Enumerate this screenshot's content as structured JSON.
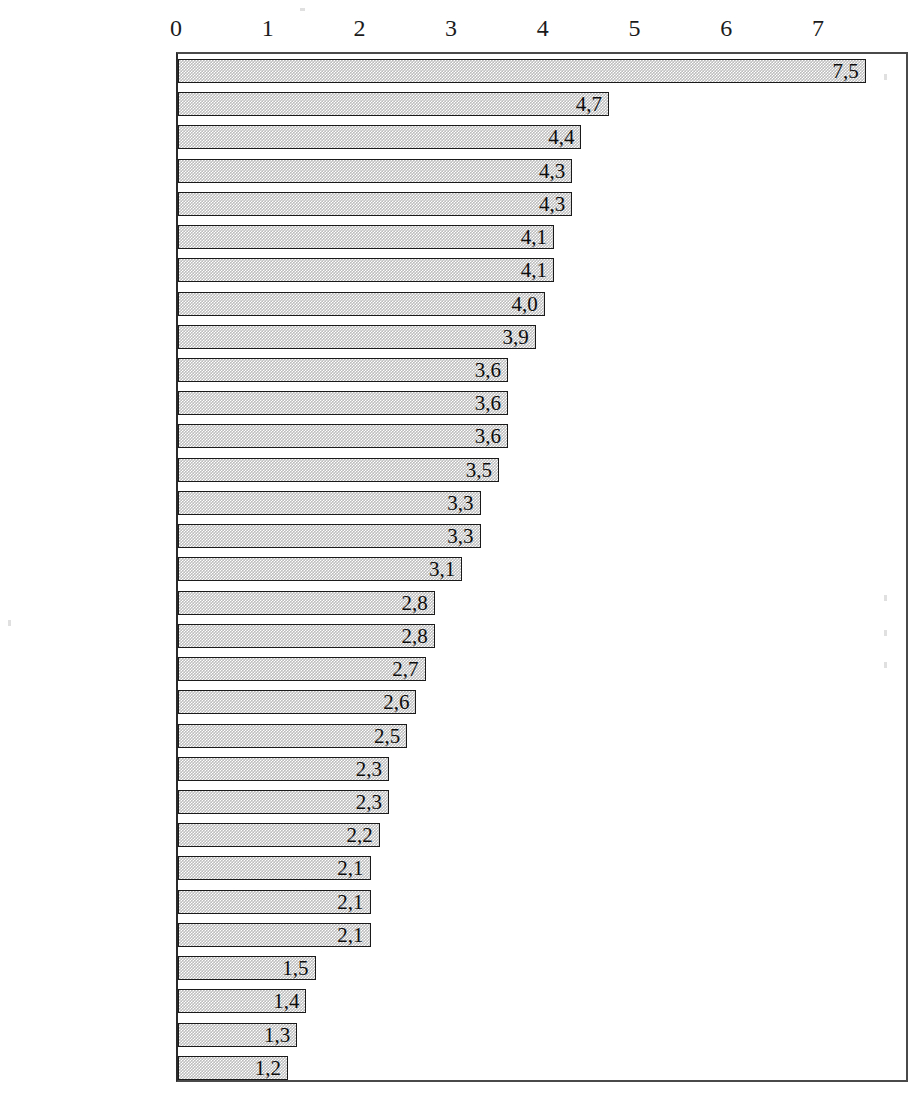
{
  "chart_data": {
    "type": "bar",
    "orientation": "horizontal",
    "title": "",
    "subtitle": "",
    "xlabel": "",
    "ylabel": "",
    "xlim": [
      0,
      7.6
    ],
    "xticks": [
      0,
      1,
      2,
      3,
      4,
      5,
      6,
      7
    ],
    "xtick_labels": [
      "0",
      "1",
      "2",
      "3",
      "4",
      "5",
      "6",
      "7"
    ],
    "grid": false,
    "legend": null,
    "decimal_separator": ",",
    "value_label_position": "inside-end",
    "bar_fill_color": "#bdbdbd",
    "bar_border_color": "#1a1a1a",
    "axis_color": "#2a2a2a",
    "categories": [
      "Irland",
      "Luxemburg",
      "Korea",
      "Island",
      "Slowak. Rep.",
      "Türkei",
      "Ungarn",
      "Polen",
      "Griechenland",
      "Mexiko",
      "Spanien",
      "Australien",
      "Finnland",
      "Verein. Staaten",
      "Kanada",
      "Neuseeland",
      "Norwegen",
      "Ver. Königreich",
      "Schweden",
      "OECD insgesamt",
      "Tschech. Rep.",
      "Portugal",
      "Niederlande",
      "Österreich",
      "Frankreich",
      "Dänemark",
      "Belgien",
      "Schweiz",
      "Deutschland",
      "Italien",
      "Japan"
    ],
    "values": [
      7.5,
      4.7,
      4.4,
      4.3,
      4.3,
      4.1,
      4.1,
      4.0,
      3.9,
      3.6,
      3.6,
      3.6,
      3.5,
      3.3,
      3.3,
      3.1,
      2.8,
      2.8,
      2.7,
      2.6,
      2.5,
      2.3,
      2.3,
      2.2,
      2.1,
      2.1,
      2.1,
      1.5,
      1.4,
      1.3,
      1.2
    ],
    "value_labels": [
      "7,5",
      "4,7",
      "4,4",
      "4,3",
      "4,3",
      "4,1",
      "4,1",
      "4,0",
      "3,9",
      "3,6",
      "3,6",
      "3,6",
      "3,5",
      "3,3",
      "3,3",
      "3,1",
      "2,8",
      "2,8",
      "2,7",
      "2,6",
      "2,5",
      "2,3",
      "2,3",
      "2,2",
      "2,1",
      "2,1",
      "2,1",
      "1,5",
      "1,4",
      "1,3",
      "1,2"
    ]
  }
}
